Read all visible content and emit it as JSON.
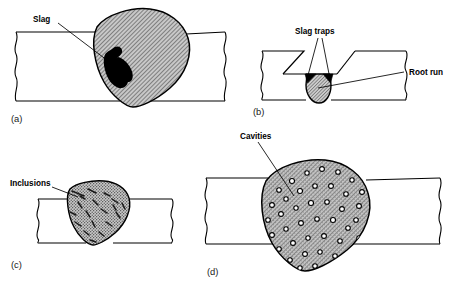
{
  "figure": {
    "background_color": "#ffffff",
    "line_color": "#000000",
    "bead_fill_color": "#b9b9b9",
    "defect_fill_color": "#000000",
    "cavity_fill_color": "#ffffff"
  },
  "panels": [
    {
      "caption": "(a)",
      "label": "Slag",
      "description": "Butt weld cross-section with large hatched weld bead and an irregular black slag inclusion on the left side of the bead"
    },
    {
      "caption": "(b)",
      "labels": {
        "top": "Slag traps",
        "right": "Root run"
      },
      "description": "V-groove preparation showing two dark triangular slag traps at the root corners and a hatched root run bead protruding below the plate"
    },
    {
      "caption": "(c)",
      "label": "Inclusions",
      "description": "Weld bead with stippled fill containing scattered dark elongated slag inclusions"
    },
    {
      "caption": "(d)",
      "label": "Cavities",
      "description": "Weld bead with hatched fill containing many small round cavities (porosity)"
    }
  ]
}
